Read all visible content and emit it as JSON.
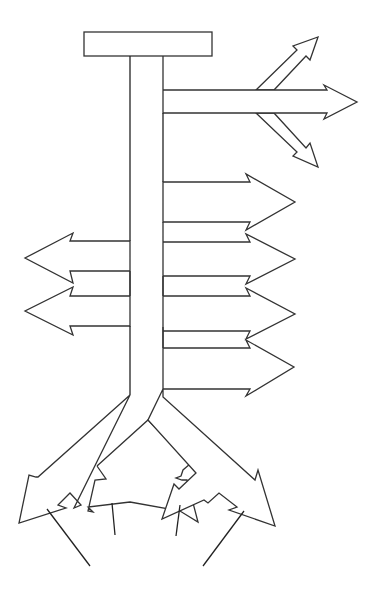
{
  "diagram": {
    "type": "arrow-tree",
    "colors": {
      "stroke": "#333333",
      "fill": "#ffffff",
      "background": "#ffffff"
    },
    "header_box": {
      "label": ""
    },
    "branches": {
      "right_top_fan": [
        "up-right arrow",
        "right arrow",
        "down-right arrow"
      ],
      "right_side": [
        "right arrow 1",
        "right arrow 2",
        "right arrow 3",
        "right arrow 4"
      ],
      "left_side": [
        "left arrow 1",
        "left arrow 2"
      ],
      "bottom": [
        "outer-left arrow",
        "inner-left arrow",
        "inner-right arrow",
        "outer-right arrow"
      ]
    }
  }
}
